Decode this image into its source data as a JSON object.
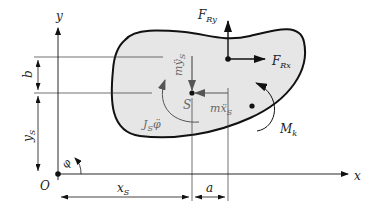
{
  "diagram": {
    "axes": {
      "x_label": "x",
      "y_label": "y",
      "origin_label": "O",
      "angle_label": "φ"
    },
    "body": {
      "fill": "#e6e6e6",
      "stroke": "#111111",
      "center_label": "S"
    },
    "forces": {
      "FRy": {
        "main": "F",
        "sub": "Ry"
      },
      "FRx": {
        "main": "F",
        "sub": "Rx"
      },
      "Mk": {
        "main": "M",
        "sub": "k"
      }
    },
    "inertial": {
      "m_ys": {
        "main": "mÿ",
        "sub": "S"
      },
      "m_xs": {
        "main": "mẍ",
        "sub": "S"
      },
      "J_phi": {
        "main": "J",
        "sub": "S",
        "tail": "φ̈"
      },
      "color": "#555555"
    },
    "dimensions": {
      "b": "b",
      "y_s": {
        "main": "y",
        "sub": "S"
      },
      "x_s": {
        "main": "x",
        "sub": "S"
      },
      "a": "a"
    }
  }
}
